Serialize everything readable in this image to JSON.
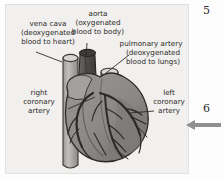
{
  "figure": {
    "kind": "anatomical-diagram",
    "labels": [
      {
        "id": "vena-cava",
        "lines": [
          "vena cava",
          "(deoxygenated",
          "blood to heart)"
        ],
        "line1": "vena cava",
        "line2": "(deoxygenated",
        "line3": "blood to heart)"
      },
      {
        "id": "aorta",
        "lines": [
          "aorta",
          "(oxygenated",
          "blood to body)"
        ],
        "line1": "aorta",
        "line2": "(oxygenated",
        "line3": "blood to body)"
      },
      {
        "id": "pulmonary-artery",
        "lines": [
          "pulmonary artery",
          "(deoxygenated",
          "blood to lungs)"
        ],
        "line1": "pulmonary artery",
        "line2": "(deoxygenated",
        "line3": "blood to lungs)"
      },
      {
        "id": "right-coronary-artery",
        "lines": [
          "right",
          "coronary",
          "artery"
        ],
        "line1": "right",
        "line2": "coronary",
        "line3": "artery"
      },
      {
        "id": "left-coronary-artery",
        "lines": [
          "left",
          "coronary",
          "artery"
        ],
        "line1": "left",
        "line2": "coronary",
        "line3": "artery"
      }
    ],
    "colors": {
      "panel_background": "#f1f0ee",
      "heart_body": "#8d8b89",
      "heart_shadow": "#6f6d6b",
      "heart_highlight": "#a3a19e",
      "vessel_light": "#b4b2af",
      "vessel_dark": "#55534f",
      "artery_line": "#3a3835",
      "outline": "#2e2c2a",
      "label_text": "#2b2a28"
    }
  },
  "margin": {
    "number_top": "5",
    "number_bottom": "6",
    "arrow": "left-arrow",
    "arrow_color": "#8f8f8f"
  }
}
